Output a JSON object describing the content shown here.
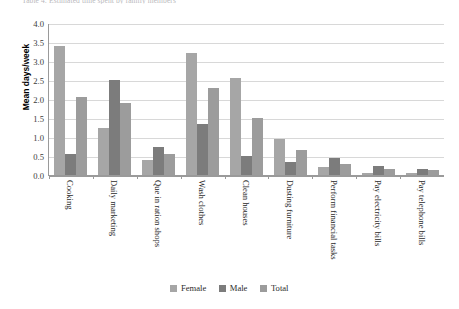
{
  "figure": {
    "caption": "Table 4: Estimated time spent by family members"
  },
  "legend": {
    "position": "bottom-center",
    "entries": [
      {
        "name": "Female",
        "color": "#a6a6a6"
      },
      {
        "name": "Male",
        "color": "#7c7c7c"
      },
      {
        "name": "Total",
        "color": "#9c9c9c"
      }
    ]
  },
  "chart_data": {
    "type": "bar",
    "title": "",
    "xlabel": "",
    "ylabel": "Mean days/week",
    "ylim": [
      0.0,
      4.0
    ],
    "ytick_labels": [
      "4.0",
      "3.5",
      "3.0",
      "2.5",
      "2.0",
      "1.5",
      "1.0",
      "0.5",
      "0.0"
    ],
    "ytick_values": [
      4.0,
      3.5,
      3.0,
      2.5,
      2.0,
      1.5,
      1.0,
      0.5,
      0.0
    ],
    "grid": "horizontal",
    "categories": [
      "Cooking",
      "Daily marketing",
      "Que in ration shops",
      "Wash clothes",
      "Clean houses",
      "Dusting furniture",
      "Perform financial tasks",
      "Pay electricity bills",
      "Pay telephone bills"
    ],
    "series": [
      {
        "name": "Female",
        "color": "#a6a6a6",
        "values": [
          3.4,
          1.25,
          0.4,
          3.2,
          2.55,
          0.95,
          0.2,
          0.05,
          0.05
        ]
      },
      {
        "name": "Male",
        "color": "#7c7c7c",
        "values": [
          0.55,
          2.5,
          0.75,
          1.35,
          0.5,
          0.35,
          0.45,
          0.25,
          0.15
        ]
      },
      {
        "name": "Total",
        "color": "#9c9c9c",
        "values": [
          2.05,
          1.9,
          0.55,
          2.3,
          1.5,
          0.65,
          0.3,
          0.15,
          0.12
        ]
      }
    ]
  }
}
